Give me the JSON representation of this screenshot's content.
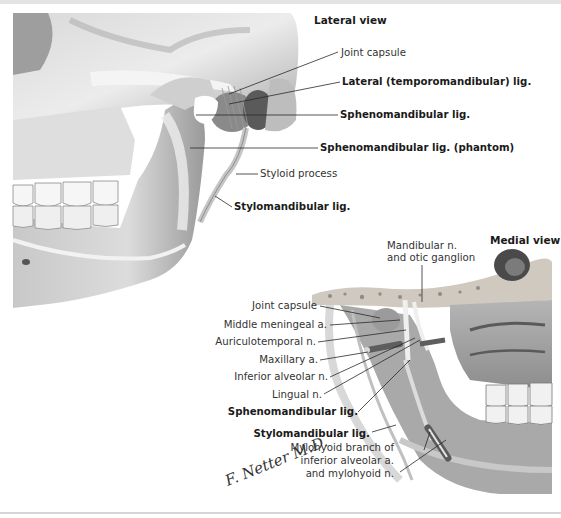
{
  "figure": {
    "palette": {
      "background": "#ffffff",
      "bone_light": "#e9e9e9",
      "bone_mid": "#bdbdbd",
      "bone_dark": "#6f6f6f",
      "leader": "#2a2a2a"
    }
  },
  "lateral_view": {
    "title": "Lateral view",
    "labels": [
      {
        "text": "Joint capsule",
        "bold": false
      },
      {
        "text": "Lateral (temporomandibular) lig.",
        "bold": true
      },
      {
        "text": "Sphenomandibular lig.",
        "bold": true
      },
      {
        "text": "Sphenomandibular lig. (phantom)",
        "bold": true
      },
      {
        "text": "Styloid process",
        "bold": false
      },
      {
        "text": "Stylomandibular lig.",
        "bold": true
      }
    ]
  },
  "medial_view": {
    "title": "Medial view",
    "top_label": {
      "line1": "Mandibular n.",
      "line2": "and otic ganglion"
    },
    "labels": [
      {
        "text": "Joint capsule",
        "bold": false
      },
      {
        "text": "Middle meningeal a.",
        "bold": false
      },
      {
        "text": "Auriculotemporal n.",
        "bold": false
      },
      {
        "text": "Maxillary a.",
        "bold": false
      },
      {
        "text": "Inferior alveolar n.",
        "bold": false
      },
      {
        "text": "Lingual n.",
        "bold": false
      },
      {
        "text": "Sphenomandibular lig.",
        "bold": true
      },
      {
        "text": "Stylomandibular lig.",
        "bold": true
      }
    ],
    "bottom_label": {
      "line1": "Mylohyoid branch of",
      "line2": "inferior alveolar a.",
      "line3": "and mylohyoid n."
    }
  },
  "signature": "F. Netter M.D."
}
